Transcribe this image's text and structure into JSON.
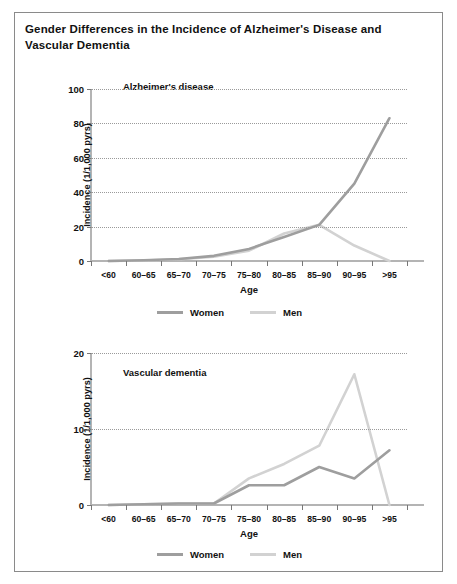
{
  "figure": {
    "title": "Gender Differences in the Incidence of Alzheimer's Disease and Vascular Dementia"
  },
  "colors": {
    "women": "#9e9e9e",
    "men": "#d2d2d2",
    "axis": "#b4b4b4",
    "grid": "#9a9a9a",
    "text": "#111111",
    "frame": "#8a8a8a"
  },
  "legend": {
    "women_label": "Women",
    "men_label": "Men"
  },
  "chart_data": [
    {
      "type": "line",
      "id": "alzheimers",
      "title": "Alzheimer's disease",
      "xlabel": "Age",
      "ylabel": "Incidence (1/1,000 pyrs)",
      "categories": [
        "<60",
        "60–65",
        "65–70",
        "70–75",
        "75–80",
        "80–85",
        "85–90",
        "90–95",
        ">95"
      ],
      "yticks": [
        0,
        20,
        40,
        60,
        80,
        100
      ],
      "ylim": [
        0,
        100
      ],
      "grid": true,
      "legend_position": "bottom",
      "series": [
        {
          "name": "Women",
          "color": "#9e9e9e",
          "values": [
            0,
            0.4,
            1.2,
            3,
            7,
            14,
            21,
            45,
            83
          ]
        },
        {
          "name": "Men",
          "color": "#d2d2d2",
          "values": [
            0,
            0.3,
            1.0,
            2.5,
            6,
            16,
            21,
            9,
            0
          ]
        }
      ]
    },
    {
      "type": "line",
      "id": "vascular",
      "title": "Vascular dementia",
      "xlabel": "Age",
      "ylabel": "Incidence (1/1,000 pyrs)",
      "categories": [
        "<60",
        "60–65",
        "65–70",
        "70–75",
        "75–80",
        "80–85",
        "85–90",
        "90–95",
        ">95"
      ],
      "yticks": [
        0,
        10,
        20
      ],
      "ylim": [
        0,
        20
      ],
      "grid": true,
      "legend_position": "bottom",
      "series": [
        {
          "name": "Women",
          "color": "#9e9e9e",
          "values": [
            0,
            0.1,
            0.2,
            0.2,
            2.6,
            2.6,
            5.0,
            3.5,
            7.2
          ]
        },
        {
          "name": "Men",
          "color": "#d2d2d2",
          "values": [
            0,
            0.1,
            0.2,
            0.2,
            3.5,
            5.4,
            7.8,
            17.2,
            0
          ]
        }
      ]
    }
  ]
}
